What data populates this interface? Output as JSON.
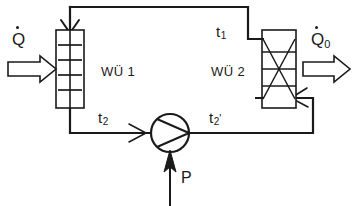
{
  "diagram": {
    "type": "process-flow-schematic",
    "stroke_color": "#1a1a1a",
    "background_color": "#ffffff",
    "components": {
      "heat_exchanger_1": {
        "label": "WÜ 1",
        "symbol": "vertical-rectangle-with-horizontal-tubes",
        "tube_lines": 4
      },
      "heat_exchanger_2": {
        "label": "WÜ 2",
        "symbol": "vertical-rectangle-with-cross-and-horizontal-tubes",
        "tube_lines": 3,
        "has_diagonal_cross": true
      },
      "pump": {
        "label": "",
        "symbol": "circle-with-triangle-impeller"
      }
    },
    "heat_flows": {
      "q_in": {
        "symbol": "Q",
        "subscript": "",
        "has_dot": true,
        "direction": "right",
        "arrow_style": "hollow-block-arrow"
      },
      "q_out": {
        "symbol": "Q",
        "subscript": "0",
        "has_dot": true,
        "direction": "right",
        "arrow_style": "hollow-block-arrow"
      },
      "power_in": {
        "symbol": "P",
        "direction": "up",
        "arrow_style": "solid-filled-arrow"
      }
    },
    "temperature_points": {
      "t1": {
        "symbol": "t",
        "subscript": "1",
        "prime": ""
      },
      "t2": {
        "symbol": "t",
        "subscript": "2",
        "prime": ""
      },
      "t2prime": {
        "symbol": "t",
        "subscript": "2",
        "prime": "'"
      }
    }
  }
}
